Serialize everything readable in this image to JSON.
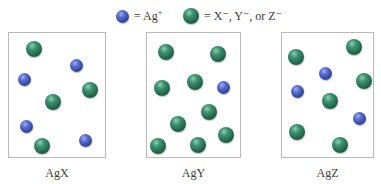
{
  "colors": {
    "ag_ion": "#3a4fa8",
    "anion": "#2e7a5a",
    "box_border": "#b9b9b9"
  },
  "legend": {
    "ag": {
      "icon": "blue-sphere",
      "text": "= Ag",
      "charge": "+"
    },
    "anion": {
      "icon": "green-sphere",
      "text": "= X",
      "full_text": "= X⁻, Y⁻, or Z⁻"
    }
  },
  "panels": [
    {
      "label": "AgX",
      "ag_count": 4,
      "anion_count": 4,
      "particles": [
        {
          "type": "anion",
          "cx": 34,
          "cy": 49
        },
        {
          "type": "ag",
          "cx": 76,
          "cy": 65
        },
        {
          "type": "ag",
          "cx": 24,
          "cy": 79
        },
        {
          "type": "anion",
          "cx": 90,
          "cy": 90
        },
        {
          "type": "anion",
          "cx": 53,
          "cy": 102
        },
        {
          "type": "ag",
          "cx": 26,
          "cy": 126
        },
        {
          "type": "ag",
          "cx": 85,
          "cy": 140
        },
        {
          "type": "anion",
          "cx": 42,
          "cy": 146
        }
      ]
    },
    {
      "label": "AgY",
      "ag_count": 1,
      "anion_count": 9,
      "particles": [
        {
          "type": "anion",
          "cx": 166,
          "cy": 52
        },
        {
          "type": "anion",
          "cx": 218,
          "cy": 54
        },
        {
          "type": "anion",
          "cx": 195,
          "cy": 82
        },
        {
          "type": "ag",
          "cx": 223,
          "cy": 87
        },
        {
          "type": "anion",
          "cx": 162,
          "cy": 88
        },
        {
          "type": "anion",
          "cx": 209,
          "cy": 112
        },
        {
          "type": "anion",
          "cx": 178,
          "cy": 124
        },
        {
          "type": "anion",
          "cx": 226,
          "cy": 135
        },
        {
          "type": "anion",
          "cx": 158,
          "cy": 146
        },
        {
          "type": "anion",
          "cx": 198,
          "cy": 145
        }
      ]
    },
    {
      "label": "AgZ",
      "ag_count": 3,
      "anion_count": 6,
      "particles": [
        {
          "type": "anion",
          "cx": 354,
          "cy": 47
        },
        {
          "type": "anion",
          "cx": 296,
          "cy": 57
        },
        {
          "type": "ag",
          "cx": 325,
          "cy": 73
        },
        {
          "type": "anion",
          "cx": 364,
          "cy": 81
        },
        {
          "type": "ag",
          "cx": 297,
          "cy": 91
        },
        {
          "type": "anion",
          "cx": 330,
          "cy": 101
        },
        {
          "type": "ag",
          "cx": 359,
          "cy": 118
        },
        {
          "type": "anion",
          "cx": 297,
          "cy": 132
        },
        {
          "type": "anion",
          "cx": 340,
          "cy": 145
        }
      ]
    }
  ]
}
